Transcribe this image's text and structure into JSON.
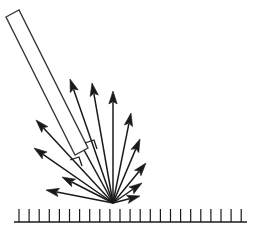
{
  "figure": {
    "type": "physics-ray-diagram",
    "width": 259,
    "height": 237,
    "background_color": "#ffffff",
    "ink_color": "#1a1a1a",
    "beam_outline_color": "#3a3a3a"
  },
  "surface": {
    "label": "hatched-ground-surface",
    "baseline": {
      "x1": 14,
      "y1": 222,
      "x2": 247,
      "y2": 222
    },
    "hatch": {
      "count": 23,
      "first_x": 19,
      "spacing": 10.1,
      "height": 13,
      "direction": "up"
    }
  },
  "incident_beam": {
    "label": "incident-beam-bar",
    "description": "long thin open rectangle representing the incoming beam",
    "corners": [
      {
        "x": 6,
        "y": 17
      },
      {
        "x": 19,
        "y": 10
      },
      {
        "x": 88,
        "y": 148
      },
      {
        "x": 75,
        "y": 155
      }
    ],
    "angle_deg": 63
  },
  "scatter_origin": {
    "x": 113,
    "y": 203
  },
  "angle_markers": [
    {
      "name": "right-angle-mark-upper",
      "points": "85,143 94,140 97,149"
    },
    {
      "name": "right-angle-mark-lower",
      "points": "70,160 79,157 82,166"
    }
  ],
  "rays": [
    {
      "id": "ray-1",
      "name": "scattered-ray-far-left-low",
      "tip_x": 46,
      "tip_y": 190,
      "angle_deg": 176
    },
    {
      "id": "ray-2",
      "name": "scattered-ray-left-low",
      "tip_x": 62,
      "tip_y": 177,
      "angle_deg": 165
    },
    {
      "id": "ray-3",
      "name": "scattered-ray-left-mid-low",
      "tip_x": 34,
      "tip_y": 148,
      "angle_deg": 149
    },
    {
      "id": "ray-4",
      "name": "scattered-ray-left-mid",
      "tip_x": 36,
      "tip_y": 120,
      "angle_deg": 140
    },
    {
      "id": "ray-5",
      "name": "scattered-ray-left-upper",
      "tip_x": 50,
      "tip_y": 88,
      "angle_deg": 131
    },
    {
      "id": "ray-6",
      "name": "scattered-ray-specular",
      "tip_x": 70,
      "tip_y": 79,
      "angle_deg": 124
    },
    {
      "id": "ray-7",
      "name": "scattered-ray-upper-left",
      "tip_x": 92,
      "tip_y": 83,
      "angle_deg": 113
    },
    {
      "id": "ray-8",
      "name": "scattered-ray-near-normal",
      "tip_x": 113,
      "tip_y": 91,
      "angle_deg": 90
    },
    {
      "id": "ray-9",
      "name": "scattered-ray-upper-right",
      "tip_x": 131,
      "tip_y": 113,
      "angle_deg": 66
    },
    {
      "id": "ray-10",
      "name": "scattered-ray-right-mid",
      "tip_x": 140,
      "tip_y": 139,
      "angle_deg": 48
    },
    {
      "id": "ray-11",
      "name": "scattered-ray-right-mid-low",
      "tip_x": 146,
      "tip_y": 163,
      "angle_deg": 34
    },
    {
      "id": "ray-12",
      "name": "scattered-ray-right-low",
      "tip_x": 142,
      "tip_y": 183,
      "angle_deg": 20
    },
    {
      "id": "ray-13",
      "name": "scattered-ray-right-grazing",
      "tip_x": 140,
      "tip_y": 196,
      "angle_deg": 11
    }
  ]
}
